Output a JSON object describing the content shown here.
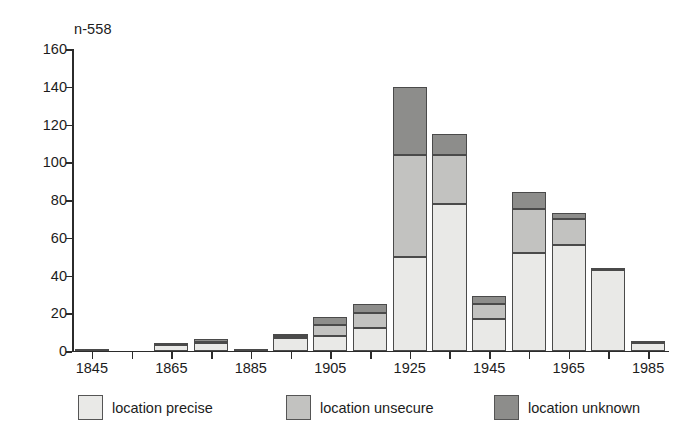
{
  "chart_data": {
    "type": "bar",
    "stacked": true,
    "title": "",
    "subtitle": "",
    "annotation": "n-558",
    "xlabel": "",
    "ylabel": "",
    "ylim": [
      0,
      160
    ],
    "ytick_step": 20,
    "yticks": [
      0,
      20,
      40,
      60,
      80,
      100,
      120,
      140,
      160
    ],
    "grid": false,
    "legend_position": "bottom",
    "xlim": [
      1840,
      1990
    ],
    "bin_width": 10,
    "categories": [
      1845,
      1855,
      1865,
      1875,
      1885,
      1895,
      1905,
      1915,
      1925,
      1935,
      1945,
      1955,
      1965,
      1975,
      1985
    ],
    "xtick_labels": [
      "1845",
      "1865",
      "1885",
      "1905",
      "1925",
      "1945",
      "1965",
      "1985"
    ],
    "xtick_values": [
      1845,
      1865,
      1885,
      1905,
      1925,
      1945,
      1965,
      1985
    ],
    "series": [
      {
        "name": "location precise",
        "color": "#e9e9e7",
        "values": [
          1,
          0,
          3,
          4,
          1,
          7,
          8,
          12,
          50,
          78,
          17,
          52,
          56,
          43,
          4
        ]
      },
      {
        "name": "location unsecure",
        "color": "#c2c2c0",
        "values": [
          0,
          0,
          1,
          1,
          0,
          1,
          6,
          8,
          54,
          26,
          8,
          23,
          14,
          0,
          0
        ]
      },
      {
        "name": "location unknown",
        "color": "#8d8d8b",
        "values": [
          0,
          0,
          0,
          1,
          0,
          1,
          4,
          5,
          36,
          11,
          4,
          9,
          3,
          1,
          1
        ]
      }
    ],
    "totals": [
      1,
      0,
      4,
      6,
      1,
      9,
      18,
      25,
      140,
      115,
      29,
      84,
      73,
      44,
      5
    ]
  },
  "legend": {
    "items": [
      {
        "label": "location precise",
        "swatch": "precise"
      },
      {
        "label": "location unsecure",
        "swatch": "unsecure"
      },
      {
        "label": "location unknown",
        "swatch": "unknown"
      }
    ]
  },
  "colors": {
    "precise": "#e9e9e7",
    "unsecure": "#c2c2c0",
    "unknown": "#8d8d8b",
    "axis": "#2b2b2b",
    "text": "#1c1c1c",
    "background": "#ffffff"
  }
}
